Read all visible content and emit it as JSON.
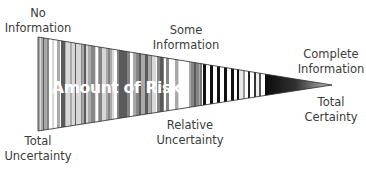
{
  "diagram": {
    "type": "tapered-wedge",
    "center_label": "Amount of Risk",
    "top_labels": [
      {
        "id": "no-information",
        "lines": [
          "No",
          "Information"
        ],
        "x": 38,
        "y": 6
      },
      {
        "id": "some-information",
        "lines": [
          "Some",
          "Information"
        ],
        "x": 186,
        "y": 23
      },
      {
        "id": "complete-information",
        "lines": [
          "Complete",
          "Information"
        ],
        "x": 331,
        "y": 47
      }
    ],
    "bottom_labels": [
      {
        "id": "total-uncertainty",
        "lines": [
          "Total",
          "Uncertainty"
        ],
        "x": 38,
        "y": 134
      },
      {
        "id": "relative-uncertainty",
        "lines": [
          "Relative",
          "Uncertainty"
        ],
        "x": 190,
        "y": 118
      },
      {
        "id": "total-certainty",
        "lines": [
          "Total",
          "Certainty"
        ],
        "x": 331,
        "y": 95
      }
    ],
    "wedge": {
      "left_x": 38,
      "top_y": 37,
      "bottom_y": 131,
      "tip_x": 332,
      "tip_y": 85,
      "colors": {
        "stripe_dark": "#222222",
        "stripe_mid": "#8a8a8a",
        "stripe_light": "#cfcfcf",
        "background": "#ffffff"
      }
    }
  }
}
